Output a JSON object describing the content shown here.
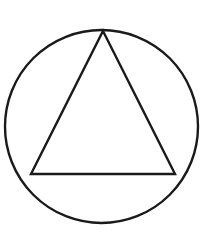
{
  "document": {
    "title": "Circle Triangle Symbol",
    "width": 204,
    "height": 232,
    "background_color": "#ffffff"
  },
  "figure": {
    "name": "circle-with-inscribed-triangle",
    "stroke_color": "#1a1a1a",
    "fill_color": "none",
    "circle": {
      "center_x": 101.5,
      "center_y": 126.5,
      "radius": 96.5,
      "stroke_width": 2.4
    },
    "triangle": {
      "stroke_width": 2.4,
      "points": "103,31 175,174 31,174",
      "vertices": [
        {
          "label": "apex",
          "x": 103,
          "y": 31
        },
        {
          "label": "bottom-right",
          "x": 175,
          "y": 174
        },
        {
          "label": "bottom-left",
          "x": 31,
          "y": 174
        }
      ]
    }
  }
}
